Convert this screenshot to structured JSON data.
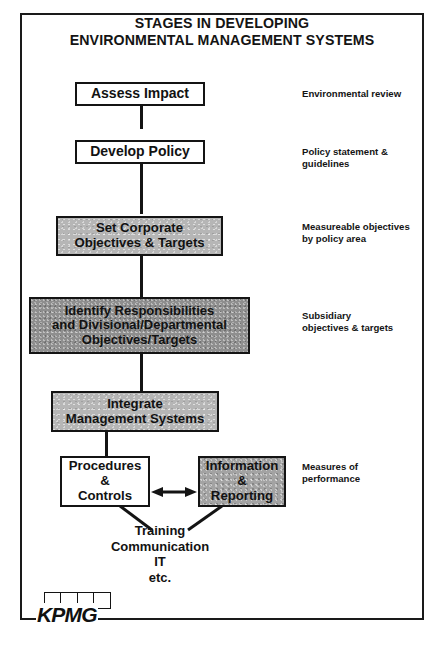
{
  "title": {
    "line1": "STAGES IN DEVELOPING",
    "line2": "ENVIRONMENTAL MANAGEMENT SYSTEMS"
  },
  "colors": {
    "ink": "#141414",
    "paper": "#ffffff",
    "shade_light": "#b6b6b6",
    "shade_mid": "#a3a3a3",
    "shade_dark": "#8e8e8e"
  },
  "nodes": [
    {
      "id": "assess-impact",
      "lines": [
        "Assess Impact"
      ],
      "fill": "white"
    },
    {
      "id": "develop-policy",
      "lines": [
        "Develop Policy"
      ],
      "fill": "white"
    },
    {
      "id": "set-corporate-objectives",
      "lines": [
        "Set Corporate",
        "Objectives & Targets"
      ],
      "fill": "shade-light"
    },
    {
      "id": "identify-responsibilities",
      "lines": [
        "Identify Responsibilities",
        "and Divisional/Departmental",
        "Objectives/Targets"
      ],
      "fill": "shade-dark"
    },
    {
      "id": "integrate-management-systems",
      "lines": [
        "Integrate",
        "Management Systems"
      ],
      "fill": "shade-light"
    },
    {
      "id": "procedures-controls",
      "lines": [
        "Procedures",
        "&",
        "Controls"
      ],
      "fill": "white"
    },
    {
      "id": "information-reporting",
      "lines": [
        "Information",
        "&",
        "Reporting"
      ],
      "fill": "shade-mid"
    }
  ],
  "annotations": [
    {
      "id": "environmental-review",
      "lines": [
        "Environmental review"
      ]
    },
    {
      "id": "policy-statement",
      "lines": [
        "Policy statement &",
        "guidelines"
      ]
    },
    {
      "id": "measureable-objectives",
      "lines": [
        "Measureable objectives",
        "by policy area"
      ]
    },
    {
      "id": "subsidiary-objectives",
      "lines": [
        "Subsidiary",
        "objectives & targets"
      ]
    },
    {
      "id": "measures-of-performance",
      "lines": [
        "Measures of",
        "performance"
      ]
    }
  ],
  "caption": {
    "lines": [
      "Training",
      "Communication",
      "IT",
      "etc."
    ]
  },
  "logo": {
    "word": "KPMG",
    "square_count": 4
  }
}
